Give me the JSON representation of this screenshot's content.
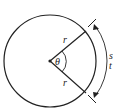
{
  "diagram": {
    "labels": {
      "radius_upper": "r",
      "radius_lower": "r",
      "angle": "θ",
      "arc_partial_1": "s",
      "arc_partial_2": "t"
    },
    "colors": {
      "stroke": "#222222",
      "background": "#ffffff"
    }
  }
}
